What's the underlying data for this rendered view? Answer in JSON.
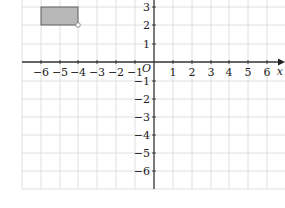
{
  "graph": {
    "x_axis_label": "x",
    "origin_label": "O",
    "x_ticks": [
      "−6",
      "−5",
      "−4",
      "−3",
      "−2",
      "−1",
      "1",
      "2",
      "3",
      "4",
      "5",
      "6"
    ],
    "y_ticks_pos": [
      "1",
      "2",
      "3"
    ],
    "y_ticks_neg": [
      "−1",
      "−2",
      "−3",
      "−4",
      "−5",
      "−6"
    ],
    "rectangle": {
      "x1": -6,
      "x2": -4,
      "y1": 2,
      "y2": 3,
      "fill": "#b8b8b8",
      "stroke": "#555555"
    },
    "marked_point": {
      "x": -4,
      "y": 2
    },
    "grid_color": "#d8d8d8",
    "axis_color": "#333333"
  }
}
